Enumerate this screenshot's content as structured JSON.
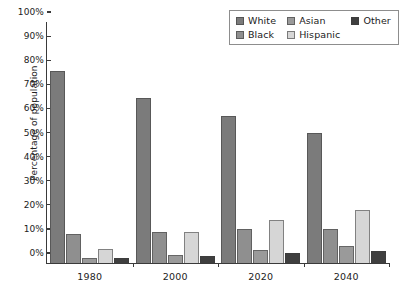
{
  "chart_data": {
    "type": "bar",
    "title": "",
    "xlabel": "",
    "ylabel": "Percentage of population",
    "categories": [
      "1980",
      "2000",
      "2020",
      "2040"
    ],
    "ylim": [
      0,
      100
    ],
    "y_ticks": [
      "0%",
      "10%",
      "20%",
      "30%",
      "40%",
      "50%",
      "60%",
      "70%",
      "80%",
      "90%",
      "100%"
    ],
    "y_tick_values": [
      0,
      10,
      20,
      30,
      40,
      50,
      60,
      70,
      80,
      90,
      100
    ],
    "grid": false,
    "legend_position": "top-right",
    "value_unit": "%",
    "series": [
      {
        "name": "White",
        "color": "#7b7b7b",
        "values": [
          79.5,
          68.5,
          61.0,
          54.0
        ]
      },
      {
        "name": "Black",
        "color": "#8f8f8f",
        "values": [
          12.0,
          13.0,
          14.0,
          14.0
        ]
      },
      {
        "name": "Asian",
        "color": "#9a9a9a",
        "values": [
          2.0,
          3.5,
          5.5,
          7.0
        ]
      },
      {
        "name": "Hispanic",
        "color": "#d6d6d6",
        "values": [
          6.0,
          13.0,
          18.0,
          22.0
        ]
      },
      {
        "name": "Other",
        "color": "#3f3f3f",
        "values": [
          2.0,
          3.0,
          4.0,
          5.0
        ]
      }
    ]
  },
  "legend": {
    "entries": [
      {
        "label": "White"
      },
      {
        "label": "Asian"
      },
      {
        "label": "Other"
      },
      {
        "label": "Black"
      },
      {
        "label": "Hispanic"
      }
    ]
  }
}
